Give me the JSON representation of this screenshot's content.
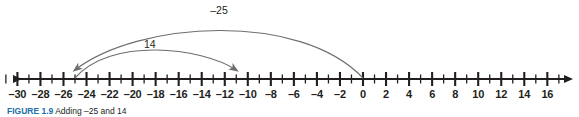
{
  "figure": {
    "caption_label": "FIGURE 1.9",
    "caption_text": "Adding –25 and 14",
    "caption_label_color": "#1a6fa8",
    "line_color": "#231f20",
    "arc_color": "#6d6e71"
  },
  "chart_data": {
    "type": "numberline",
    "title": "Adding –25 and 14",
    "axis": {
      "min": -31.5,
      "max": 17.5,
      "tick_min": -31,
      "tick_max": 17,
      "tick_step": 1,
      "label_step": 2,
      "left_arrow": true,
      "right_arrow": true,
      "origin": 0
    },
    "tick_labels": [
      {
        "value": -30,
        "text": "–30"
      },
      {
        "value": -28,
        "text": "–28"
      },
      {
        "value": -26,
        "text": "–26"
      },
      {
        "value": -24,
        "text": "–24"
      },
      {
        "value": -22,
        "text": "–22"
      },
      {
        "value": -20,
        "text": "–20"
      },
      {
        "value": -18,
        "text": "–18"
      },
      {
        "value": -16,
        "text": "–16"
      },
      {
        "value": -14,
        "text": "–14"
      },
      {
        "value": -12,
        "text": "–12"
      },
      {
        "value": -10,
        "text": "–10"
      },
      {
        "value": -8,
        "text": "–8"
      },
      {
        "value": -6,
        "text": "–6"
      },
      {
        "value": -4,
        "text": "–4"
      },
      {
        "value": -2,
        "text": "–2"
      },
      {
        "value": 0,
        "text": "0"
      },
      {
        "value": 2,
        "text": "2"
      },
      {
        "value": 4,
        "text": "4"
      },
      {
        "value": 6,
        "text": "6"
      },
      {
        "value": 8,
        "text": "8"
      },
      {
        "value": 10,
        "text": "10"
      },
      {
        "value": 12,
        "text": "12"
      },
      {
        "value": 14,
        "text": "14"
      },
      {
        "value": 16,
        "text": "16"
      }
    ],
    "jumps": [
      {
        "name": "jump-minus-25",
        "label": "–25",
        "from": 0,
        "to": -25,
        "direction": "left",
        "height": 58,
        "label_value": -12.5,
        "label_y": 4
      },
      {
        "name": "jump-plus-14",
        "label": "14",
        "from": -25,
        "to": -11,
        "direction": "right",
        "height": 32,
        "label_value": -18.5,
        "label_y": 38
      }
    ]
  }
}
